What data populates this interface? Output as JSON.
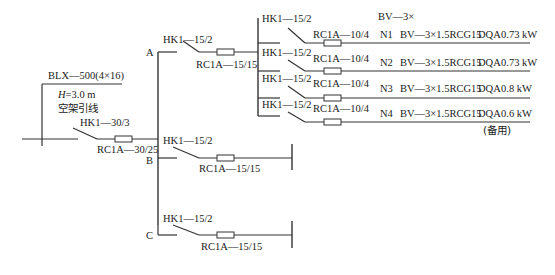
{
  "incoming": {
    "cable": "BLX—500(4×16)",
    "height_label": "H",
    "height_value": "=3.0 m",
    "note": "空架引线",
    "main_switch": "HK1—30/3",
    "main_fuse": "RC1A—30/25"
  },
  "branches": {
    "A": {
      "label": "A",
      "switch": "HK1—15/2",
      "fuse": "RC1A—15/15"
    },
    "B": {
      "label": "B",
      "switch": "HK1—15/2",
      "fuse": "RC1A—15/15"
    },
    "C": {
      "label": "C",
      "switch": "HK1—15/2",
      "fuse": "RC1A—15/15"
    }
  },
  "circuits_header": "BV—3×",
  "circuits": [
    {
      "id": "N1",
      "switch": "HK1—15/2",
      "fuse": "RC1A—10/4",
      "cable": "BV—3×1.5RCG15",
      "method": "DQA",
      "power": "0.73 kW"
    },
    {
      "id": "N2",
      "switch": "HK1—15/2",
      "fuse": "RC1A—10/4",
      "cable": "BV—3×1.5RCG15",
      "method": "DQA",
      "power": "0.73 kW"
    },
    {
      "id": "N3",
      "switch": "HK1—15/2",
      "fuse": "RC1A—10/4",
      "cable": "BV—3×1.5RCG15",
      "method": "DQA",
      "power": "0.8 kW"
    },
    {
      "id": "N4",
      "switch": "HK1—15/2",
      "fuse": "RC1A—10/4",
      "cable": "BV—3×1.5RCG15",
      "method": "DQA",
      "power": "0.6 kW"
    }
  ],
  "spare_note": "(备用)"
}
